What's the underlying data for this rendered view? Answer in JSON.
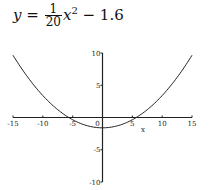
{
  "title": {
    "lhs": "y",
    "equals": "=",
    "frac_num": "1",
    "frac_den": "20",
    "var": "x",
    "exp": "2",
    "rest": "− 1.6"
  },
  "chart_data": {
    "type": "line",
    "xlabel": "x",
    "ylabel": "",
    "xlim": [
      -15,
      15
    ],
    "ylim": [
      -10,
      10
    ],
    "x_ticks": [
      -15,
      -10,
      -5,
      0,
      5,
      10,
      15
    ],
    "x_tick_labels": [
      "-15",
      "-10",
      "-5",
      "0",
      "5",
      "10",
      "15"
    ],
    "y_ticks": [
      -10,
      -5,
      5,
      10
    ],
    "y_tick_labels": [
      "-10",
      "-5",
      "5",
      "10"
    ],
    "grid": false,
    "legend": null,
    "series": [
      {
        "name": "y = x^2/20 - 1.6",
        "x": [
          -15,
          -12.5,
          -10,
          -7.5,
          -5.657,
          -5,
          -2.5,
          0,
          2.5,
          5,
          5.657,
          7.5,
          10,
          12.5,
          15
        ],
        "y": [
          9.65,
          6.21,
          3.4,
          1.21,
          0,
          -0.35,
          -1.29,
          -1.6,
          -1.29,
          -0.35,
          0,
          1.21,
          3.4,
          6.21,
          9.65
        ]
      }
    ],
    "annotations": []
  }
}
